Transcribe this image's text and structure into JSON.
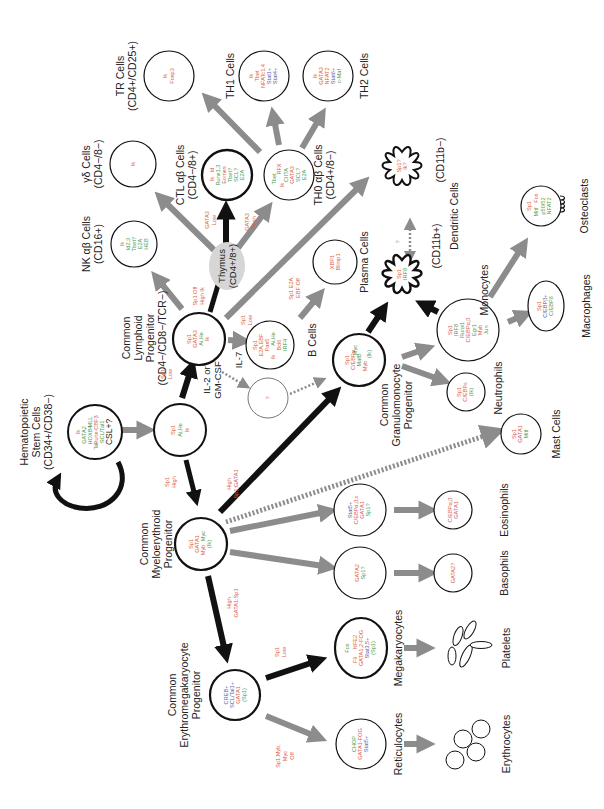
{
  "diagram": {
    "orientation": "rotated-90-ccw",
    "colors": {
      "factor_red": "#d9604a",
      "factor_green": "#4f9a4f",
      "factor_blue": "#5b5fa8",
      "arrow_major": "#111111",
      "arrow_minor": "#8c8c8c",
      "thymus_fill": "#d6d6d6"
    },
    "cells": {
      "hsc": {
        "label": [
          "Hematopoietic",
          "Stem Cells",
          "(CD34+/CD38−)"
        ],
        "factors": [
          {
            "t": "Ik",
            "c": "red"
          },
          {
            "t": "GATA2",
            "c": "grn"
          },
          {
            "t": "HOXB4",
            "c": "grn"
          },
          {
            "t": "MLL",
            "c": "grn"
          },
          {
            "t": "Tel",
            "c": "grn"
          },
          {
            "t": "Runx-CBFβ",
            "c": "red"
          },
          {
            "t": "SCL/Tal1",
            "c": "grn"
          },
          {
            "t": "CSL+?",
            "c": "blk"
          }
        ]
      },
      "mpp": {
        "label": [],
        "factors": [
          {
            "t": "Sp1",
            "c": "red"
          },
          {
            "t": "Ai,He",
            "c": "grn"
          },
          {
            "t": "Ik",
            "c": "red"
          }
        ]
      },
      "clp": {
        "label": [
          "Common",
          "Lymphoid",
          "Progenitor",
          "(CD4−/CD8−/TCR−)"
        ],
        "factors": [
          {
            "t": "Sp1",
            "c": "red"
          },
          {
            "t": "GATA3",
            "c": "red"
          },
          {
            "t": "Ai,He",
            "c": "grn"
          },
          {
            "t": "Ik",
            "c": "red"
          }
        ]
      },
      "thymus": {
        "label": [
          "Thymus",
          "(CD4+/8+)"
        ]
      },
      "nk": {
        "label": [
          "NK αβ Cells",
          "(CD16+)"
        ],
        "factors": [
          {
            "t": "Ik",
            "c": "red"
          },
          {
            "t": "Id2,3",
            "c": "grn"
          },
          {
            "t": "Tbet?",
            "c": "grn"
          },
          {
            "t": "E2A",
            "c": "grn"
          },
          {
            "t": "HEB",
            "c": "grn"
          }
        ]
      },
      "gd": {
        "label": [
          "γδ Cells",
          "(CD4−/8−)"
        ],
        "factors": [
          {
            "t": "Ik",
            "c": "red"
          }
        ]
      },
      "ctl": {
        "label": [
          "CTL αβ Cells",
          "(CD4−/8+)"
        ],
        "factors": [
          {
            "t": "Ik",
            "c": "red"
          },
          {
            "t": "Id",
            "c": "red"
          },
          {
            "t": "Runx1,3",
            "c": "grn"
          },
          {
            "t": "Eomes",
            "c": "red"
          },
          {
            "t": "Tbet?",
            "c": "grn"
          },
          {
            "t": "SCL?",
            "c": "grn"
          },
          {
            "t": "E2A",
            "c": "grn"
          }
        ]
      },
      "th0": {
        "label": [
          "TH0 αβ Cells",
          "(CD4+/8−)"
        ],
        "factors": [
          {
            "t": "Tbet",
            "c": "grn"
          },
          {
            "t": "RFX",
            "c": "red"
          },
          {
            "t": "Ik",
            "c": "red"
          },
          {
            "t": "CIITA",
            "c": "grn"
          },
          {
            "t": "GATA3",
            "c": "red"
          },
          {
            "t": "SCL?",
            "c": "grn"
          },
          {
            "t": "E2A",
            "c": "grn"
          }
        ]
      },
      "tr": {
        "label": [
          "TR Cells",
          "(CD4+/CD25+)"
        ],
        "factors": [
          {
            "t": "Ik",
            "c": "red"
          },
          {
            "t": "Foxp3",
            "c": "red"
          }
        ]
      },
      "th1": {
        "label": [
          "TH1 Cells"
        ],
        "factors": [
          {
            "t": "Ik",
            "c": "red"
          },
          {
            "t": "Tbet",
            "c": "red"
          },
          {
            "t": "NFATc1,4",
            "c": "red"
          },
          {
            "t": "Stat1+",
            "c": "blu"
          },
          {
            "t": "Stat4+",
            "c": "blu"
          }
        ]
      },
      "th2": {
        "label": [
          "TH2 Cells"
        ],
        "factors": [
          {
            "t": "Ik",
            "c": "red"
          },
          {
            "t": "GATA3",
            "c": "red"
          },
          {
            "t": "NFAT2",
            "c": "red"
          },
          {
            "t": "Stat6+",
            "c": "blu"
          },
          {
            "t": "c-Maf",
            "c": "grn"
          }
        ]
      },
      "dc_neg": {
        "label": [
          "(CD11b−)"
        ],
        "factors": [
          {
            "t": "Sp1?",
            "c": "red"
          },
          {
            "t": "Ik?",
            "c": "red"
          }
        ]
      },
      "dc_pos": {
        "label": [
          "(CD11b+)"
        ],
        "factors": [
          {
            "t": "Sp1",
            "c": "red"
          },
          {
            "t": "IRF8",
            "c": "grn"
          }
        ]
      },
      "dendritic": {
        "label": [
          "Dendritic Cells"
        ]
      },
      "bcell": {
        "label": [
          "B Cells"
        ],
        "factors": [
          {
            "t": "Sp1",
            "c": "red"
          },
          {
            "t": "E2A,EBF",
            "c": "red"
          },
          {
            "t": "Pax5",
            "c": "red"
          },
          {
            "t": "Ai,He",
            "c": "grn"
          },
          {
            "t": "Ik",
            "c": "red"
          },
          {
            "t": "Bcl6",
            "c": "red"
          },
          {
            "t": "IRF4",
            "c": "grn"
          }
        ]
      },
      "plasma_pre": {
        "label": [],
        "factors": [
          {
            "t": "XBP1",
            "c": "red"
          },
          {
            "t": "Blimp1",
            "c": "red"
          }
        ]
      },
      "plasma": {
        "label": [
          "Plasma Cells"
        ]
      },
      "unknown": {
        "label": [],
        "factors": [
          {
            "t": "?",
            "c": "red"
          }
        ]
      },
      "cgmp": {
        "label": [
          "Common",
          "Granulomonocyte",
          "Progenitor"
        ],
        "factors": [
          {
            "t": "Sp1",
            "c": "red"
          },
          {
            "t": "C/EBPα",
            "c": "red"
          },
          {
            "t": "MafB",
            "c": "grn"
          },
          {
            "t": "Myc",
            "c": "grn"
          },
          {
            "t": "Myb",
            "c": "red"
          },
          {
            "t": "(Ik)",
            "c": "grn"
          }
        ]
      },
      "mono": {
        "label": [
          "Monocytes"
        ],
        "factors": [
          {
            "t": "Sp1",
            "c": "red"
          },
          {
            "t": "IRF8",
            "c": "grn"
          },
          {
            "t": "Runx1",
            "c": "grn"
          },
          {
            "t": "C/EBPα,β",
            "c": "red"
          },
          {
            "t": "Egr1",
            "c": "grn"
          },
          {
            "t": "Myb",
            "c": "red"
          },
          {
            "t": "Jun",
            "c": "grn"
          }
        ]
      },
      "neutro": {
        "label": [
          "Neutrophils"
        ],
        "factors": [
          {
            "t": "Sp1",
            "c": "red"
          },
          {
            "t": "C/EBPε",
            "c": "red"
          },
          {
            "t": "(Ik)",
            "c": "grn"
          }
        ]
      },
      "osteo": {
        "label": [
          "Osteoclasts"
        ],
        "factors": [
          {
            "t": "Sp1",
            "c": "red"
          },
          {
            "t": "Mitf",
            "c": "grn"
          },
          {
            "t": "Fos",
            "c": "red"
          },
          {
            "t": "p50/52",
            "c": "grn"
          },
          {
            "t": "NFAT2",
            "c": "grn"
          }
        ]
      },
      "macro": {
        "label": [
          "Macrophages"
        ],
        "factors": [
          {
            "t": "Sp1",
            "c": "red"
          },
          {
            "t": "C/EBPβ+",
            "c": "blu"
          },
          {
            "t": "C/EBPδ",
            "c": "grn"
          }
        ]
      },
      "mast": {
        "label": [
          "Mast Cells"
        ],
        "factors": [
          {
            "t": "Sp1",
            "c": "red"
          },
          {
            "t": "GATA1",
            "c": "red"
          },
          {
            "t": "Mitf",
            "c": "grn"
          }
        ]
      },
      "cmep": {
        "label": [
          "Common",
          "Myeloerythroid",
          "Progenitor"
        ],
        "factors": [
          {
            "t": "Sp1",
            "c": "red"
          },
          {
            "t": "GATA1",
            "c": "red"
          },
          {
            "t": "Myb",
            "c": "red"
          },
          {
            "t": "Myc",
            "c": "grn"
          },
          {
            "t": "(Ik)",
            "c": "grn"
          }
        ]
      },
      "eos_pre": {
        "label": [],
        "factors": [
          {
            "t": "Stat5+",
            "c": "blu"
          },
          {
            "t": "C/EBPα,β,ε",
            "c": "red"
          },
          {
            "t": "GATA1",
            "c": "red"
          },
          {
            "t": "Sp1?",
            "c": "grn"
          }
        ]
      },
      "eos": {
        "label": [
          "Eosinophils"
        ],
        "factors": [
          {
            "t": "C/EBPα,β",
            "c": "red"
          },
          {
            "t": "GATA1",
            "c": "red"
          }
        ]
      },
      "baso_pre": {
        "label": [],
        "factors": [
          {
            "t": "GATA2",
            "c": "red"
          },
          {
            "t": "Sp1?",
            "c": "grn"
          }
        ]
      },
      "baso": {
        "label": [
          "Basophils"
        ],
        "factors": [
          {
            "t": "GATA2?",
            "c": "red"
          }
        ]
      },
      "cemp": {
        "label": [
          "Common",
          "Erythromegakaryocyte",
          "Progenitor"
        ],
        "factors": [
          {
            "t": "CREB+",
            "c": "blu"
          },
          {
            "t": "SCL/Tal1+",
            "c": "blu"
          },
          {
            "t": "GATA1",
            "c": "red"
          },
          {
            "t": "(Sp1)",
            "c": "grn"
          }
        ]
      },
      "mega": {
        "label": [
          "Megakaryocytes"
        ],
        "factors": [
          {
            "t": "Fos",
            "c": "grn"
          },
          {
            "t": "Fli",
            "c": "red"
          },
          {
            "t": "NFE2",
            "c": "red"
          },
          {
            "t": "GATA1,2-FOG",
            "c": "red"
          },
          {
            "t": "Stat3,5+",
            "c": "blu"
          },
          {
            "t": "(Sp1)",
            "c": "grn"
          }
        ]
      },
      "platelets": {
        "label": [
          "Platelets"
        ]
      },
      "retic": {
        "label": [
          "Reticulocytes"
        ],
        "factors": [
          {
            "t": "CHOP",
            "c": "grn"
          },
          {
            "t": "GATA1-FOG",
            "c": "red"
          },
          {
            "t": "Stat5+",
            "c": "blu"
          }
        ]
      },
      "erythro": {
        "label": [
          "Erythrocytes"
        ]
      }
    },
    "conditions": {
      "spi_low_clp": [
        "Sp1",
        "Low"
      ],
      "spi_high_cmep": [
        "Sp1",
        "High"
      ],
      "high_spi_gata": [
        "High",
        "Sp1:GATA1"
      ],
      "spi_off_high_ik": [
        "Sp1 Off",
        "High Ik"
      ],
      "spi_low_b": [
        "Sp1",
        "Low"
      ],
      "spi_e2a_ebf_off": [
        "Sp1 E2A,",
        "EBF Off"
      ],
      "gata3_low": [
        "GATA3",
        "Low"
      ],
      "gata3_high": [
        "GATA3",
        "High"
      ],
      "high_gata_spi": [
        "High",
        "GATA1:Sp1"
      ],
      "spi_low_mega": [
        "Sp1",
        "Low"
      ],
      "spi_myb_off": [
        "Sp1,Myb,",
        "Myc",
        "Off"
      ]
    },
    "cytokines": {
      "il7": "IL-7",
      "il2_gmcsf": [
        "IL-2 or",
        "GM-CSF"
      ],
      "dc_link": "?"
    }
  }
}
